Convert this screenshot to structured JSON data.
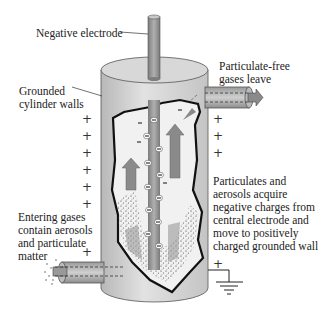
{
  "diagram": {
    "labels": {
      "negative_electrode": "Negative electrode",
      "gases_leave_1": "Particulate-free",
      "gases_leave_2": "gases leave",
      "cylinder_walls_1": "Grounded",
      "cylinder_walls_2": "cylinder walls",
      "particulates_1": "Particulates and",
      "particulates_2": "aerosols acquire",
      "particulates_3": "negative charges from",
      "particulates_4": "central electrode and",
      "particulates_5": "move to positively",
      "particulates_6": "charged grounded wall",
      "entering_1": "Entering gases",
      "entering_2": "contain aerosols",
      "entering_3": "and particulate",
      "entering_4": "matter"
    },
    "symbols": {
      "positive": "+",
      "negative": "−"
    },
    "components": [
      "negative-electrode",
      "grounded-cylinder",
      "inlet-pipe",
      "outlet-pipe",
      "ground-symbol",
      "cutaway-interior"
    ],
    "colors": {
      "cylinder_fill": "#d0d0d0",
      "electrode_fill": "#999999",
      "arrow_fill": "#8a8a8a",
      "outline": "#111111"
    }
  }
}
